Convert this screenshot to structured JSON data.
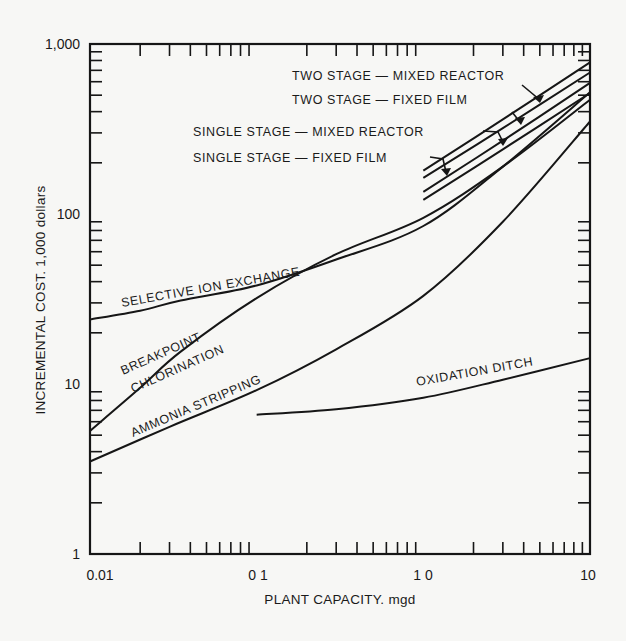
{
  "chart_data": {
    "type": "line",
    "title": "",
    "xlabel": "PLANT CAPACITY, mgd",
    "ylabel": "INCREMENTAL COST, 1,000 dollars",
    "xscale": "log",
    "yscale": "log",
    "xlim": [
      0.01,
      10
    ],
    "ylim": [
      1,
      1000
    ],
    "grid": false,
    "legend": "none (labels placed directly on curves)",
    "x_ticks": [
      {
        "value": 0.01,
        "label": "0.01"
      },
      {
        "value": 0.1,
        "label": "0.1"
      },
      {
        "value": 1.0,
        "label": "1.0"
      },
      {
        "value": 10,
        "label": "10"
      }
    ],
    "y_ticks": [
      {
        "value": 1,
        "label": "1"
      },
      {
        "value": 10,
        "label": "10"
      },
      {
        "value": 100,
        "label": "100"
      },
      {
        "value": 1000,
        "label": "1,000"
      }
    ],
    "series": [
      {
        "name": "SELECTIVE ION EXCHANGE",
        "x": [
          0.01,
          0.02,
          0.035,
          0.1,
          0.3,
          1.0,
          3.0,
          10
        ],
        "y": [
          24,
          27,
          31,
          38,
          54,
          85,
          190,
          520
        ]
      },
      {
        "name": "BREAKPOINT CHLORINATION",
        "x": [
          0.01,
          0.02,
          0.035,
          0.1,
          0.3,
          1.0,
          3.0,
          10
        ],
        "y": [
          5.3,
          9.5,
          15.5,
          32,
          58,
          95,
          190,
          470
        ]
      },
      {
        "name": "AMMONIA STRIPPING",
        "x": [
          0.01,
          0.03,
          0.1,
          0.3,
          1.0,
          3.0,
          10
        ],
        "y": [
          3.5,
          5.6,
          9.2,
          16,
          33,
          90,
          350
        ]
      },
      {
        "name": "OXIDATION DITCH",
        "x": [
          0.1,
          0.3,
          1.0,
          3.0,
          10
        ],
        "y": [
          6.6,
          7.1,
          8.3,
          10.6,
          14.2
        ]
      },
      {
        "name": "TWO STAGE — MIXED REACTOR",
        "x": [
          1.0,
          3.0,
          10
        ],
        "y": [
          180,
          360,
          780
        ]
      },
      {
        "name": "TWO STAGE — FIXED FILM",
        "x": [
          1.0,
          3.0,
          10
        ],
        "y": [
          163,
          320,
          680
        ]
      },
      {
        "name": "SINGLE STAGE — MIXED REACTOR",
        "x": [
          1.0,
          3.0,
          10
        ],
        "y": [
          135,
          270,
          590
        ]
      },
      {
        "name": "SINGLE STAGE — FIXED FILM",
        "x": [
          1.0,
          3.0,
          10
        ],
        "y": [
          121,
          240,
          515
        ]
      }
    ],
    "annotations": [
      {
        "text": "TWO STAGE — MIXED REACTOR",
        "points_to": "TWO STAGE — MIXED REACTOR"
      },
      {
        "text": "TWO STAGE — FIXED FILM",
        "points_to": "TWO STAGE — FIXED FILM"
      },
      {
        "text": "SINGLE STAGE — MIXED REACTOR",
        "points_to": "SINGLE STAGE — MIXED REACTOR"
      },
      {
        "text": "SINGLE STAGE — FIXED FILM",
        "points_to": "SINGLE STAGE — FIXED FILM"
      }
    ]
  },
  "labels": {
    "selective": "SELECTIVE ION EXCHANGE",
    "breakpoint_1": "BREAKPOINT",
    "breakpoint_2": "CHLORINATION",
    "ammonia": "AMMONIA STRIPPING",
    "oxidation": "OXIDATION DITCH",
    "two_mixed": "TWO STAGE — MIXED REACTOR",
    "two_fixed": "TWO STAGE — FIXED FILM",
    "single_mixed": "SINGLE STAGE — MIXED REACTOR",
    "single_fixed": "SINGLE STAGE — FIXED FILM"
  },
  "axes": {
    "x_title": "PLANT CAPACITY. mgd",
    "y_title": "INCREMENTAL COST. 1,000 dollars",
    "x_tick_labels": [
      "0.01",
      "0 1",
      "1 0",
      "10"
    ],
    "y_tick_labels": [
      "1",
      "10",
      "100",
      "1,000"
    ]
  }
}
